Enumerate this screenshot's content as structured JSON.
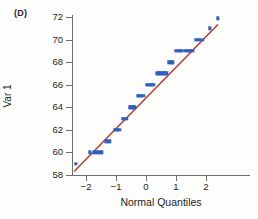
{
  "figure": {
    "panel_label": "(D)",
    "marker_color": "#2f5fbf",
    "line_color": "#c0392b",
    "axis_color": "#6e6e6e",
    "background": "#fdfdfb"
  },
  "chart_data": {
    "type": "scatter",
    "title": "",
    "subtitle": "",
    "xlabel": "Normal Quantiles",
    "ylabel": "Var 1",
    "xlim": [
      -2.6,
      2.65
    ],
    "ylim": [
      57.6,
      72.6
    ],
    "xticks": [
      -2,
      -1,
      0,
      1,
      2
    ],
    "xtick_labels": [
      "−2",
      "−1",
      "0",
      "1",
      "2"
    ],
    "yticks": [
      58,
      60,
      62,
      64,
      66,
      68,
      70,
      72
    ],
    "ytick_labels": [
      "58",
      "60",
      "62",
      "64",
      "66",
      "68",
      "70",
      "72"
    ],
    "grid": false,
    "legend": null,
    "annotations": [
      "(D)"
    ],
    "series": [
      {
        "name": "Sample quantiles",
        "type": "scatter",
        "marker": "square",
        "color": "#2f5fbf",
        "x": [
          -2.33,
          -1.88,
          -1.72,
          -1.62,
          -1.54,
          -1.47,
          -1.33,
          -1.27,
          -1.21,
          -1.05,
          -0.99,
          -0.94,
          -0.89,
          -0.78,
          -0.72,
          -0.66,
          -0.55,
          -0.49,
          -0.44,
          -0.39,
          -0.28,
          -0.23,
          -0.18,
          -0.13,
          -0.08,
          0.02,
          0.07,
          0.12,
          0.17,
          0.22,
          0.27,
          0.38,
          0.43,
          0.48,
          0.53,
          0.58,
          0.63,
          0.68,
          0.78,
          0.84,
          0.9,
          1.0,
          1.06,
          1.12,
          1.18,
          1.3,
          1.36,
          1.42,
          1.48,
          1.54,
          1.66,
          1.73,
          1.8,
          1.89,
          2.12,
          2.4
        ],
        "y": [
          59,
          60,
          60,
          60,
          60,
          60,
          61,
          61,
          61,
          62,
          62,
          62,
          62,
          63,
          63,
          63,
          64,
          64,
          64,
          64,
          65,
          65,
          65,
          65,
          65,
          66,
          66,
          66,
          66,
          66,
          66,
          67,
          67,
          67,
          67,
          67,
          67,
          67,
          68,
          68,
          68,
          69,
          69,
          69,
          69,
          69,
          69,
          69,
          69,
          69,
          70,
          70,
          70,
          70,
          71,
          71.9
        ]
      },
      {
        "name": "Reference line",
        "type": "line",
        "color": "#c0392b",
        "x": [
          -2.38,
          2.38
        ],
        "y": [
          58.35,
          71.3
        ]
      }
    ]
  }
}
